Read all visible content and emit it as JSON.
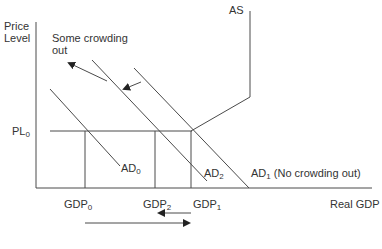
{
  "diagram": {
    "axes": {
      "y_label_line1": "Price",
      "y_label_line2": "Level",
      "x_label": "Real GDP"
    },
    "labels": {
      "as": "AS",
      "crowding_line1": "Some crowding",
      "crowding_line2": "out",
      "pl": "PL",
      "pl_sub": "0",
      "ad0": "AD",
      "ad0_sub": "0",
      "ad2": "AD",
      "ad2_sub": "2",
      "ad1": "AD",
      "ad1_sub": "1",
      "ad1_note": " (No crowding out)",
      "gdp0": "GDP",
      "gdp0_sub": "0",
      "gdp2": "GDP",
      "gdp2_sub": "2",
      "gdp1": "GDP",
      "gdp1_sub": "1"
    },
    "colors": {
      "line": "#4a4a4a",
      "text": "#333333",
      "background": "#ffffff"
    }
  }
}
